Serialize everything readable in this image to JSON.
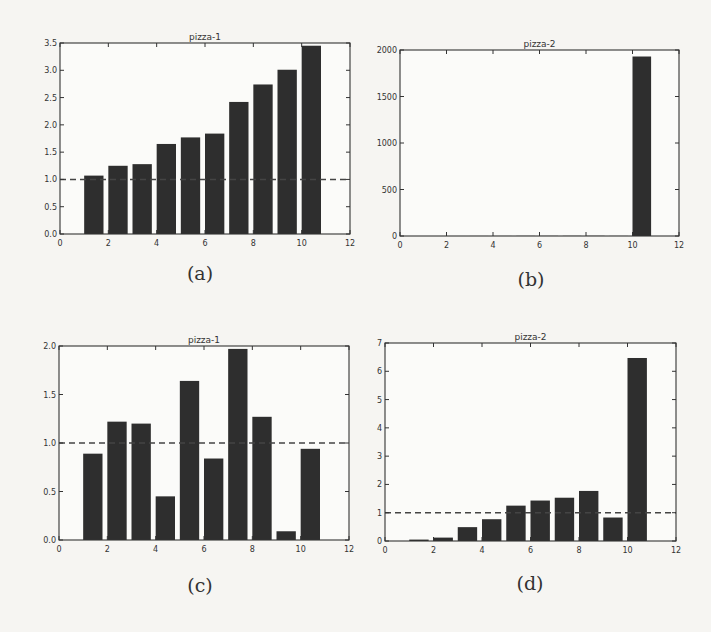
{
  "figure": {
    "captions": [
      "(a)",
      "(b)",
      "(c)",
      "(d)"
    ]
  },
  "style": {
    "bar_color": "#2e2e2e",
    "axis_color": "#333333",
    "reference_line_color": "#444444",
    "background": "#f6f5f2"
  },
  "chart_data": [
    {
      "id": "a",
      "type": "bar",
      "title": "pizza-1",
      "caption": "(a)",
      "x": [
        1,
        2,
        3,
        4,
        5,
        6,
        7,
        8,
        9,
        10
      ],
      "values": [
        1.07,
        1.25,
        1.28,
        1.65,
        1.77,
        1.84,
        2.42,
        2.74,
        3.01,
        3.45
      ],
      "bar_width": 0.8,
      "xlim": [
        0,
        12
      ],
      "ylim": [
        0,
        3.5
      ],
      "xticks": [
        0,
        2,
        4,
        6,
        8,
        10,
        12
      ],
      "yticks": [
        0.0,
        0.5,
        1.0,
        1.5,
        2.0,
        2.5,
        3.0,
        3.5
      ],
      "ytick_labels": [
        "0.0",
        "0.5",
        "1.0",
        "1.5",
        "2.0",
        "2.5",
        "3.0",
        "3.5"
      ],
      "reference_line": {
        "y": 1.0,
        "style": "dashed"
      },
      "xlabel": "",
      "ylabel": "",
      "grid": false
    },
    {
      "id": "b",
      "type": "bar",
      "title": "pizza-2",
      "caption": "(b)",
      "x": [
        1,
        2,
        3,
        4,
        5,
        6,
        7,
        8,
        9,
        10
      ],
      "values": [
        0.05,
        0.12,
        0.49,
        0.77,
        1.25,
        1.43,
        1.53,
        1.77,
        0.83,
        1930
      ],
      "bar_width": 0.8,
      "xlim": [
        0,
        12
      ],
      "ylim": [
        0,
        2000
      ],
      "xticks": [
        0,
        2,
        4,
        6,
        8,
        10,
        12
      ],
      "yticks": [
        0,
        500,
        1000,
        1500,
        2000
      ],
      "ytick_labels": [
        "0",
        "500",
        "1000",
        "1500",
        "2000"
      ],
      "reference_line": null,
      "xlabel": "",
      "ylabel": "",
      "grid": false
    },
    {
      "id": "c",
      "type": "bar",
      "title": "pizza-1",
      "caption": "(c)",
      "x": [
        1,
        2,
        3,
        4,
        5,
        6,
        7,
        8,
        9,
        10
      ],
      "values": [
        0.89,
        1.22,
        1.2,
        0.45,
        1.64,
        0.84,
        1.97,
        1.27,
        0.09,
        0.94
      ],
      "bar_width": 0.8,
      "xlim": [
        0,
        12
      ],
      "ylim": [
        0,
        2.0
      ],
      "xticks": [
        0,
        2,
        4,
        6,
        8,
        10,
        12
      ],
      "yticks": [
        0.0,
        0.5,
        1.0,
        1.5,
        2.0
      ],
      "ytick_labels": [
        "0.0",
        "0.5",
        "1.0",
        "1.5",
        "2.0"
      ],
      "reference_line": {
        "y": 1.0,
        "style": "dashed"
      },
      "xlabel": "",
      "ylabel": "",
      "grid": false
    },
    {
      "id": "d",
      "type": "bar",
      "title": "pizza-2",
      "caption": "(d)",
      "x": [
        1,
        2,
        3,
        4,
        5,
        6,
        7,
        8,
        9,
        10
      ],
      "values": [
        0.05,
        0.12,
        0.49,
        0.77,
        1.25,
        1.43,
        1.53,
        1.77,
        0.83,
        6.47
      ],
      "bar_width": 0.8,
      "xlim": [
        0,
        12
      ],
      "ylim": [
        0,
        7
      ],
      "xticks": [
        0,
        2,
        4,
        6,
        8,
        10,
        12
      ],
      "yticks": [
        0,
        1,
        2,
        3,
        4,
        5,
        6,
        7
      ],
      "ytick_labels": [
        "0",
        "1",
        "2",
        "3",
        "4",
        "5",
        "6",
        "7"
      ],
      "reference_line": {
        "y": 1.0,
        "style": "dashed"
      },
      "xlabel": "",
      "ylabel": "",
      "grid": false
    }
  ]
}
